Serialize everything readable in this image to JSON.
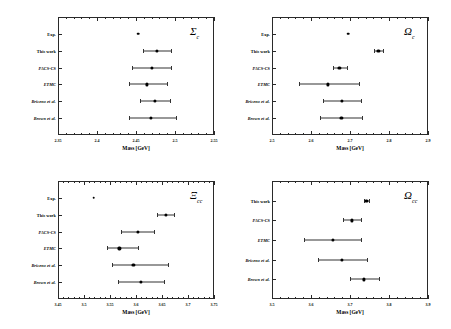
{
  "figure": {
    "title": "",
    "axis_title": "Mass [GeV]",
    "marker_color": "#000000",
    "frame_color": "#2a2a2a"
  },
  "chart_data": [
    {
      "type": "scatter",
      "panel_id": "sigma-c",
      "title": "Σ",
      "title_sub": "c",
      "xlabel": "Mass [GeV]",
      "ylabel": "",
      "xlim": [
        2.35,
        2.55
      ],
      "xticks": [
        2.35,
        2.4,
        2.45,
        2.5,
        2.55
      ],
      "xticklabels": [
        "2.35",
        "2.4",
        "2.45",
        "2.5",
        "2.55"
      ],
      "xminor_step": 0.01,
      "grid": false,
      "legend": "none",
      "categories": [
        "Exp.",
        "This work",
        "PACS-CS",
        "ETMC",
        "Briceno et al.",
        "Brown et al."
      ],
      "points": [
        {
          "label": "Exp.",
          "value": 2.4529,
          "err_low": 0.0,
          "err_high": 0.0
        },
        {
          "label": "This work",
          "value": 2.4768,
          "err_low": 0.0182,
          "err_high": 0.018
        },
        {
          "label": "PACS-CS",
          "value": 2.47,
          "err_low": 0.025,
          "err_high": 0.0255
        },
        {
          "label": "ETMC",
          "value": 2.464,
          "err_low": 0.023,
          "err_high": 0.026
        },
        {
          "label": "Briceno et al.",
          "value": 2.474,
          "err_low": 0.0195,
          "err_high": 0.02
        },
        {
          "label": "Brown et al.",
          "value": 2.4695,
          "err_low": 0.029,
          "err_high": 0.0315
        }
      ]
    },
    {
      "type": "scatter",
      "panel_id": "omega-c",
      "title": "Ω",
      "title_sub": "c",
      "xlabel": "Mass [GeV]",
      "ylabel": "",
      "xlim": [
        2.5,
        2.9
      ],
      "xticks": [
        2.5,
        2.6,
        2.7,
        2.8,
        2.9
      ],
      "xticklabels": [
        "2.5",
        "2.6",
        "2.7",
        "2.8",
        "2.9"
      ],
      "xminor_step": 0.02,
      "grid": false,
      "legend": "none",
      "categories": [
        "Exp.",
        "This work",
        "PACS-CS",
        "ETMC",
        "Briceno et al.",
        "Brown et al."
      ],
      "points": [
        {
          "label": "Exp.",
          "value": 2.6952,
          "err_low": 0.0,
          "err_high": 0.0
        },
        {
          "label": "This work",
          "value": 2.773,
          "err_low": 0.0115,
          "err_high": 0.0115
        },
        {
          "label": "PACS-CS",
          "value": 2.673,
          "err_low": 0.0175,
          "err_high": 0.0195
        },
        {
          "label": "ETMC",
          "value": 2.643,
          "err_low": 0.074,
          "err_high": 0.079
        },
        {
          "label": "Briceno et al.",
          "value": 2.679,
          "err_low": 0.049,
          "err_high": 0.05
        },
        {
          "label": "Brown et al.",
          "value": 2.678,
          "err_low": 0.055,
          "err_high": 0.053
        }
      ]
    },
    {
      "type": "scatter",
      "panel_id": "xi-cc",
      "title": "Ξ",
      "title_sub": "cc",
      "xlabel": "Mass [GeV]",
      "ylabel": "",
      "xlim": [
        3.45,
        3.75
      ],
      "xticks": [
        3.45,
        3.5,
        3.55,
        3.6,
        3.65,
        3.7,
        3.75
      ],
      "xticklabels": [
        "3.45",
        "3.5",
        "3.55",
        "3.6",
        "3.65",
        "3.7",
        "3.75"
      ],
      "xminor_step": 0.01,
      "grid": false,
      "legend": "none",
      "categories": [
        "Exp.",
        "This work",
        "PACS-CS",
        "ETMC",
        "Briceno et al.",
        "Brown et al."
      ],
      "points": [
        {
          "label": "Exp.",
          "value": 3.519,
          "err_low": 0.0,
          "err_high": 0.0
        },
        {
          "label": "This work",
          "value": 3.658,
          "err_low": 0.0175,
          "err_high": 0.0145
        },
        {
          "label": "PACS-CS",
          "value": 3.603,
          "err_low": 0.0325,
          "err_high": 0.0325
        },
        {
          "label": "ETMC",
          "value": 3.568,
          "err_low": 0.023,
          "err_high": 0.036
        },
        {
          "label": "Briceno et al.",
          "value": 3.595,
          "err_low": 0.042,
          "err_high": 0.066
        },
        {
          "label": "Brown et al.",
          "value": 3.61,
          "err_low": 0.044,
          "err_high": 0.044
        }
      ]
    },
    {
      "type": "scatter",
      "panel_id": "omega-cc",
      "title": "Ω",
      "title_sub": "cc",
      "xlabel": "Mass [GeV]",
      "ylabel": "",
      "xlim": [
        3.5,
        3.9
      ],
      "xticks": [
        3.5,
        3.6,
        3.7,
        3.8,
        3.9
      ],
      "xticklabels": [
        "3.5",
        "3.6",
        "3.7",
        "3.8",
        "3.9"
      ],
      "xminor_step": 0.02,
      "grid": false,
      "legend": "none",
      "categories": [
        "This work",
        "PACS-CS",
        "ETMC",
        "Briceno et al.",
        "Brown et al."
      ],
      "points": [
        {
          "label": "This work",
          "value": 3.742,
          "err_low": 0.006,
          "err_high": 0.006
        },
        {
          "label": "PACS-CS",
          "value": 3.704,
          "err_low": 0.023,
          "err_high": 0.023
        },
        {
          "label": "ETMC",
          "value": 3.657,
          "err_low": 0.076,
          "err_high": 0.071
        },
        {
          "label": "Briceno et al.",
          "value": 3.679,
          "err_low": 0.062,
          "err_high": 0.064
        },
        {
          "label": "Brown et al.",
          "value": 3.736,
          "err_low": 0.035,
          "err_high": 0.039
        }
      ]
    }
  ]
}
